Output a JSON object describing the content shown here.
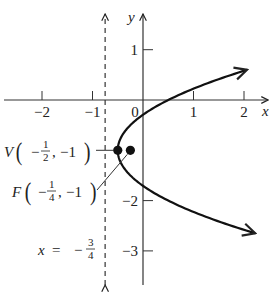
{
  "chart_data": {
    "type": "line",
    "title": "",
    "equation": "(y + 1)^2 = x + 1/2",
    "xlabel": "x",
    "ylabel": "y",
    "xlim": [
      -2.8,
      2.55
    ],
    "ylim": [
      -3.6,
      1.95
    ],
    "grid": false,
    "x_ticks": [
      {
        "value": -2,
        "label": "−2"
      },
      {
        "value": -1,
        "label": "−1"
      },
      {
        "value": 0,
        "label": "0"
      },
      {
        "value": 1,
        "label": "1"
      },
      {
        "value": 2,
        "label": "2"
      }
    ],
    "y_ticks": [
      {
        "value": 1,
        "label": "1"
      },
      {
        "value": -2,
        "label": "−2"
      },
      {
        "value": -3,
        "label": "−3"
      }
    ],
    "series": [
      {
        "name": "parabola",
        "description": "x = (y + 1)^2 - 1/2, opening right",
        "y_range": [
          -2.65,
          0.6
        ],
        "vertex": {
          "x": -0.5,
          "y": -1
        }
      }
    ],
    "directrix": {
      "x": -0.75,
      "label_prefix": "x = −",
      "label_num": "3",
      "label_den": "4",
      "style": "dashed"
    },
    "points": [
      {
        "name": "vertex",
        "x": -0.5,
        "y": -1,
        "letter": "V",
        "num": "1",
        "den": "2",
        "ycoord": "−1"
      },
      {
        "name": "focus",
        "x": -0.25,
        "y": -1,
        "letter": "F",
        "num": "1",
        "den": "4",
        "ycoord": "−1"
      }
    ]
  }
}
